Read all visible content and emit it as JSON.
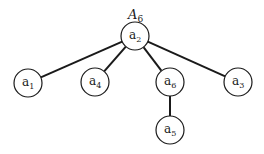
{
  "title": {
    "main": "A",
    "sub": "6",
    "x": 128,
    "y": 19
  },
  "colors": {
    "stroke": "#1a1a1a",
    "background": "#ffffff"
  },
  "nodes": [
    {
      "id": "a2",
      "base": "a",
      "sub": "2",
      "cx": 135,
      "cy": 36,
      "r": 14
    },
    {
      "id": "a1",
      "base": "a",
      "sub": "1",
      "cx": 28,
      "cy": 83,
      "r": 14
    },
    {
      "id": "a4",
      "base": "a",
      "sub": "4",
      "cx": 95,
      "cy": 82,
      "r": 14
    },
    {
      "id": "a6",
      "base": "a",
      "sub": "6",
      "cx": 170,
      "cy": 82,
      "r": 14
    },
    {
      "id": "a3",
      "base": "a",
      "sub": "3",
      "cx": 238,
      "cy": 82,
      "r": 14
    },
    {
      "id": "a5",
      "base": "a",
      "sub": "5",
      "cx": 170,
      "cy": 130,
      "r": 14
    }
  ],
  "edges": [
    {
      "from": "a2",
      "to": "a1"
    },
    {
      "from": "a2",
      "to": "a4"
    },
    {
      "from": "a2",
      "to": "a6"
    },
    {
      "from": "a2",
      "to": "a3"
    },
    {
      "from": "a6",
      "to": "a5"
    }
  ]
}
